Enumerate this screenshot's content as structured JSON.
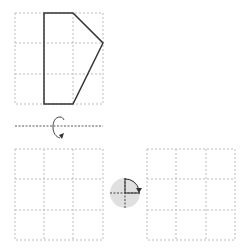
{
  "puzzle": {
    "description": "Spatial reasoning: reflect shape across horizontal axis, then rotate 90 degrees clockwise",
    "top_grid": {
      "rows": 3,
      "cols": 3,
      "x": 15,
      "y": 13,
      "cell": 30
    },
    "shape_points": "44,13 73,13 103,43 73,104 44,104",
    "flip_axis": {
      "y": 126,
      "x1": 15,
      "x2": 103
    },
    "flip_icon": "vertical-flip-rotation-arrow-icon",
    "answer_grid": {
      "rows": 3,
      "cols": 3,
      "x": 15,
      "y": 149,
      "cell": 30
    },
    "rotate_icon": "rotate-clockwise-90-icon",
    "result_grid": {
      "rows": 3,
      "cols": 3,
      "x": 147,
      "y": 149,
      "cell": 30
    },
    "colors": {
      "grid_line": "#bbbbbb",
      "shape_stroke": "#333333",
      "axis_line": "#555555",
      "rotate_circle": "#e0e0e0"
    }
  }
}
